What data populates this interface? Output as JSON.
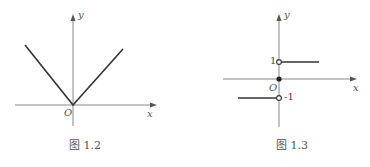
{
  "figures": [
    {
      "caption": "图 1.2",
      "axis_x_label": "x",
      "axis_y_label": "y",
      "origin_label": "O",
      "description": "Graph of y = |x|"
    },
    {
      "caption": "图 1.3",
      "axis_x_label": "x",
      "axis_y_label": "y",
      "origin_label": "O",
      "tick_pos": "1",
      "tick_neg": "-1",
      "description": "Graph of sign function: y=1 for x>0, y=0 at x=0, y=-1 for x<0"
    }
  ],
  "colors": {
    "axis": "#888888",
    "curve": "#333333"
  }
}
